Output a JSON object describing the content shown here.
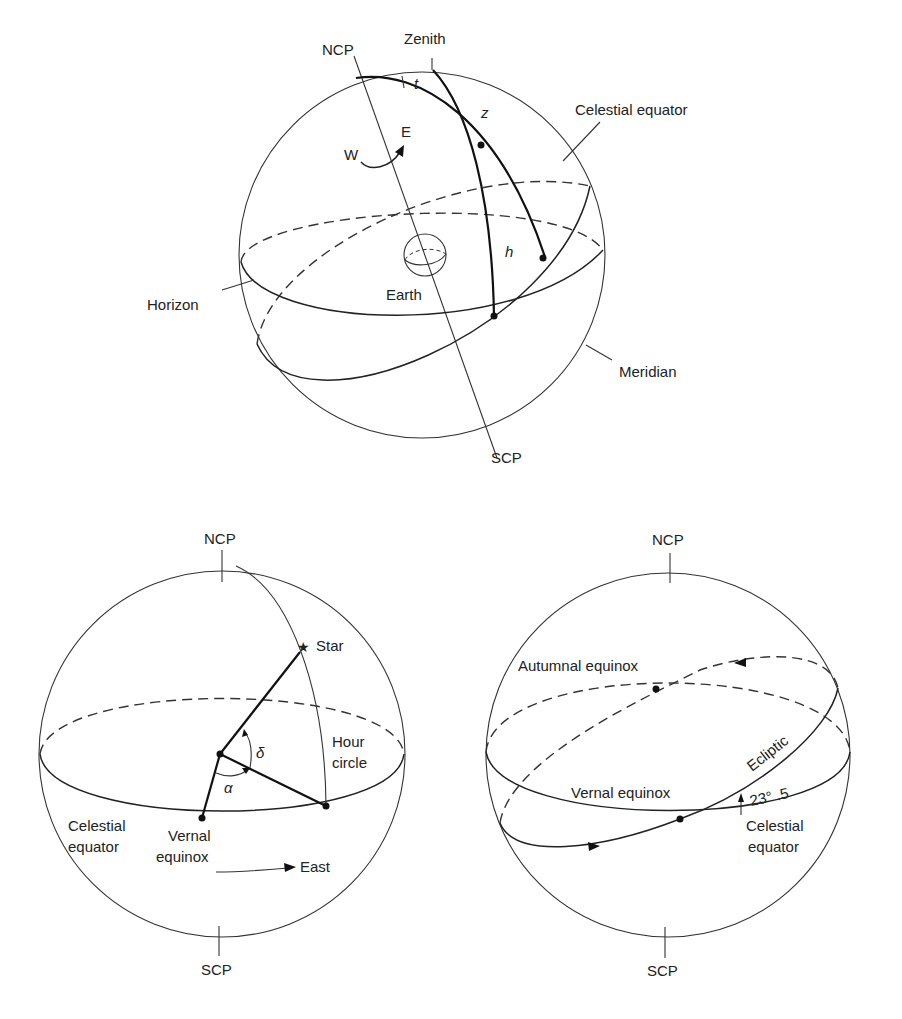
{
  "top_caption_fragment": "",
  "diagram_top": {
    "title": "Horizon and equatorial systems on the celestial sphere",
    "labels": {
      "ncp": "NCP",
      "zenith": "Zenith",
      "t": "t",
      "z": "z",
      "h": "h",
      "w": "W",
      "e": "E",
      "celestial_equator": "Celestial equator",
      "horizon": "Horizon",
      "earth": "Earth",
      "meridian": "Meridian",
      "scp": "SCP"
    }
  },
  "diagram_left": {
    "title": "Right ascension and declination",
    "labels": {
      "ncp": "NCP",
      "star": "Star",
      "delta": "δ",
      "alpha": "α",
      "hour_circle_1": "Hour",
      "hour_circle_2": "circle",
      "celestial_equator_1": "Celestial",
      "celestial_equator_2": "equator",
      "vernal_equinox_1": "Vernal",
      "vernal_equinox_2": "equinox",
      "east": "East",
      "scp": "SCP"
    }
  },
  "diagram_right": {
    "title": "Ecliptic and equinoxes",
    "labels": {
      "ncp": "NCP",
      "autumnal_equinox": "Autumnal equinox",
      "ecliptic": "Ecliptic",
      "vernal_equinox": "Vernal equinox",
      "obliquity": "23° .5",
      "celestial_equator_1": "Celestial",
      "celestial_equator_2": "equator",
      "scp": "SCP"
    }
  }
}
